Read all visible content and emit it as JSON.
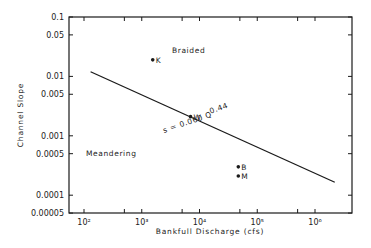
{
  "chart_data": {
    "type": "scatter",
    "title": "",
    "xlabel": "Bankfull Discharge (cfs)",
    "ylabel": "Channel Slope",
    "x_scale": "log",
    "y_scale": "log",
    "xlim": [
      50,
      3000000
    ],
    "ylim": [
      5e-05,
      0.1
    ],
    "x_ticks": [
      100,
      1000,
      10000,
      100000,
      1000000
    ],
    "x_tick_labels": [
      "10²",
      "10³",
      "10⁴",
      "10⁵",
      "10⁶"
    ],
    "y_ticks": [
      0.1,
      0.05,
      0.01,
      0.005,
      0.001,
      0.0005,
      0.0001,
      5e-05
    ],
    "y_tick_labels": [
      "0.1",
      "0.05",
      "0.01",
      "0.005",
      "0.001",
      "0.0005",
      "0.0001",
      "0.00005"
    ],
    "grid": false,
    "legend": null,
    "series": [
      {
        "name": "Rivers",
        "type": "scatter",
        "points": [
          {
            "label": "K",
            "x": 1550,
            "y": 0.019
          },
          {
            "label": "W",
            "x": 7000,
            "y": 0.0021
          },
          {
            "label": "B",
            "x": 47000,
            "y": 0.0003
          },
          {
            "label": "M",
            "x": 47000,
            "y": 0.00021
          }
        ]
      },
      {
        "name": "Threshold line",
        "type": "line",
        "equation": "s = 0.060 Q^-0.44",
        "coefficient": 0.06,
        "exponent": -0.44,
        "x_range": [
          130,
          2200000
        ]
      }
    ],
    "annotations": [
      {
        "text": "Braided",
        "region": "above line"
      },
      {
        "text": "Meandering",
        "region": "below line"
      },
      {
        "text": "s = 0.060 Q",
        "superscript": "-0.44"
      }
    ]
  }
}
